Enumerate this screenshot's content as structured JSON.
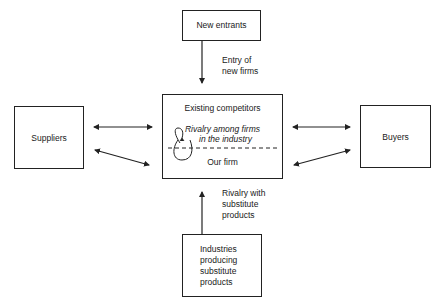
{
  "diagram": {
    "type": "five-forces",
    "nodes": {
      "new_entrants": {
        "label": "New entrants"
      },
      "existing_competitors": {
        "title": "Existing competitors",
        "rivalry_line1": "Rivalry among firms",
        "rivalry_line2": "in the industry",
        "our_firm": "Our firm"
      },
      "suppliers": {
        "label": "Suppliers"
      },
      "buyers": {
        "label": "Buyers"
      },
      "substitutes": {
        "line1": "Industries",
        "line2": "producing",
        "line3": "substitute",
        "line4": "products"
      }
    },
    "edges": {
      "entry": {
        "line1": "Entry of",
        "line2": "new firms",
        "from": "New entrants",
        "to": "Existing competitors"
      },
      "substitution": {
        "line1": "Rivalry with",
        "line2": "substitute",
        "line3": "products",
        "from": "Industries producing substitute products",
        "to": "Existing competitors"
      },
      "suppliers_link": {
        "from": "Suppliers",
        "to": "Existing competitors",
        "bidirectional": true
      },
      "buyers_link": {
        "from": "Buyers",
        "to": "Existing competitors",
        "bidirectional": true
      }
    },
    "colors": {
      "line": "#222222",
      "background": "#ffffff",
      "text": "#1a1a1a"
    }
  }
}
